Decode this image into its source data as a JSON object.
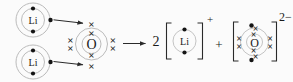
{
  "figure": {
    "kind": "dot-and-cross electron transfer diagram",
    "colors": {
      "ink": "#1a1a1a",
      "shell_gray": "#b3b3b3",
      "background": "#fbfbfb"
    },
    "symbols": {
      "cross": "×",
      "dot": "●"
    },
    "reactants": {
      "lithium_atoms": [
        {
          "label": "Li",
          "inner_shell_electrons": 2,
          "outer_shell_electrons": 1,
          "electron_symbol": "dot"
        },
        {
          "label": "Li",
          "inner_shell_electrons": 2,
          "outer_shell_electrons": 1,
          "electron_symbol": "dot"
        }
      ],
      "oxygen_atom": {
        "label": "O",
        "inner_shell_electrons": 2,
        "outer_shell_electrons": 6,
        "electron_symbol": "cross"
      },
      "transfer_arrows": 2
    },
    "products": {
      "coefficient": "2",
      "lithium_ion": {
        "label": "Li",
        "charge": "+",
        "shell_electrons": 2,
        "electron_symbol": "dot"
      },
      "plus_sign": "+",
      "oxide_ion": {
        "label": "O",
        "charge": "2−",
        "inner_shell_electrons": 2,
        "outer_shell_crosses": 6,
        "outer_shell_dots_gained": 2
      }
    }
  }
}
